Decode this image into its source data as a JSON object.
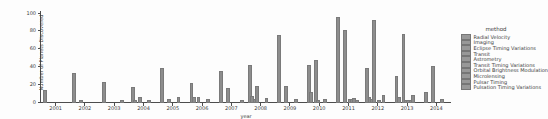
{
  "chart_data": {
    "type": "bar",
    "title": "",
    "xlabel": "year",
    "ylabel": "Number of Planets Discovered",
    "ylim": [
      0,
      100
    ],
    "yticks": [
      0,
      20,
      40,
      60,
      80,
      100
    ],
    "grid": false,
    "legend_title": "method",
    "legend_position": "right",
    "bar_color": "#8d8d8d",
    "categories": [
      "2001",
      "2002",
      "2003",
      "2004",
      "2005",
      "2006",
      "2007",
      "2008",
      "2009",
      "2010",
      "2011",
      "2012",
      "2013",
      "2014"
    ],
    "series": [
      {
        "name": "Radial Velocity",
        "values": [
          12,
          31,
          21,
          16,
          37,
          20,
          34,
          41,
          74,
          41,
          94,
          37,
          28,
          10
        ]
      },
      {
        "name": "Imaging",
        "values": [
          0,
          0,
          0,
          1,
          0,
          4,
          0,
          6,
          0,
          10,
          0,
          4,
          5,
          0
        ]
      },
      {
        "name": "Eclipse Timing Variations",
        "values": [
          0,
          0,
          0,
          0,
          0,
          0,
          0,
          2,
          0,
          0,
          0,
          2,
          0,
          0
        ]
      },
      {
        "name": "Transit",
        "values": [
          0,
          1,
          0,
          5,
          2,
          4,
          15,
          17,
          17,
          46,
          80,
          91,
          75,
          39
        ]
      },
      {
        "name": "Astrometry",
        "values": [
          0,
          0,
          0,
          0,
          0,
          0,
          0,
          0,
          0,
          1,
          0,
          0,
          1,
          0
        ]
      },
      {
        "name": "Transit Timing Variations",
        "values": [
          0,
          0,
          0,
          0,
          0,
          0,
          0,
          0,
          0,
          0,
          2,
          1,
          1,
          0
        ]
      },
      {
        "name": "Orbital Brightness Modulation",
        "values": [
          0,
          0,
          0,
          0,
          0,
          0,
          0,
          0,
          0,
          0,
          2,
          0,
          1,
          0
        ]
      },
      {
        "name": "Microlensing",
        "values": [
          0,
          0,
          0,
          1,
          5,
          2,
          0,
          3,
          2,
          2,
          3,
          7,
          7,
          2
        ]
      },
      {
        "name": "Pulsar Timing",
        "values": [
          0,
          0,
          1,
          0,
          0,
          0,
          0,
          0,
          0,
          0,
          1,
          0,
          0,
          0
        ]
      },
      {
        "name": "Pulsation Timing Variations",
        "values": [
          0,
          0,
          0,
          0,
          0,
          0,
          1,
          0,
          0,
          0,
          0,
          0,
          0,
          0
        ]
      }
    ]
  }
}
